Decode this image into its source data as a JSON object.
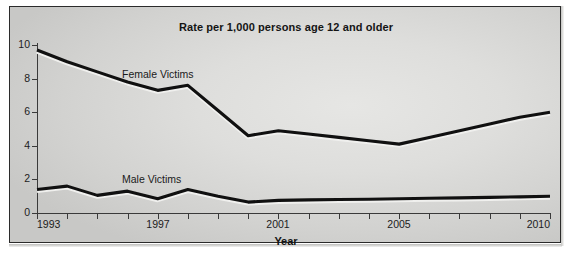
{
  "chart_data": {
    "type": "line",
    "title": "Rate per 1,000 persons age 12 and older",
    "xlabel": "Year",
    "ylabel": "",
    "grid": false,
    "legend_position": "inline-labels",
    "xlim": [
      1993,
      2010
    ],
    "ylim": [
      0,
      10
    ],
    "ytick_labels": [
      "0",
      "2",
      "4",
      "6",
      "8",
      "10"
    ],
    "ytick_values": [
      0,
      2,
      4,
      6,
      8,
      10
    ],
    "xtick_values": [
      1993,
      1994,
      1995,
      1996,
      1997,
      1998,
      1999,
      2000,
      2001,
      2002,
      2003,
      2004,
      2005,
      2006,
      2007,
      2008,
      2009,
      2010
    ],
    "xtick_labels_shown": [
      "1993",
      "1997",
      "2001",
      "2005",
      "2010"
    ],
    "x": [
      1993,
      1994,
      1995,
      1996,
      1997,
      1998,
      1999,
      2000,
      2001,
      2002,
      2003,
      2004,
      2005,
      2006,
      2007,
      2008,
      2009,
      2010
    ],
    "series": [
      {
        "name": "Female Victims",
        "color": "#101010",
        "values": [
          9.7,
          9.0,
          8.4,
          7.8,
          7.3,
          7.6,
          6.1,
          4.6,
          4.9,
          4.7,
          4.5,
          4.3,
          4.1,
          4.5,
          4.9,
          5.3,
          5.7,
          6.0
        ]
      },
      {
        "name": "Male Victims",
        "color": "#101010",
        "values": [
          1.4,
          1.6,
          1.05,
          1.3,
          0.85,
          1.4,
          1.0,
          0.65,
          0.75,
          0.78,
          0.8,
          0.82,
          0.85,
          0.88,
          0.9,
          0.93,
          0.96,
          1.0
        ]
      }
    ]
  },
  "labels": {
    "female": "Female Victims",
    "male": "Male Victims"
  }
}
